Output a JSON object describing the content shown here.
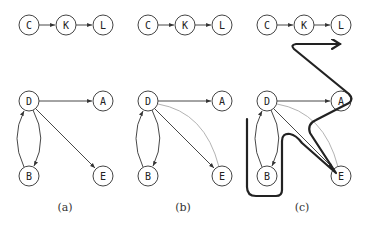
{
  "panels": [
    {
      "caption": "(a)",
      "nodes": {
        "C": "C",
        "K": "K",
        "L": "L",
        "D": "D",
        "A": "A",
        "B": "B",
        "E": "E"
      }
    },
    {
      "caption": "(b)",
      "nodes": {
        "C": "C",
        "K": "K",
        "L": "L",
        "D": "D",
        "A": "A",
        "B": "B",
        "E": "E"
      }
    },
    {
      "caption": "(c)",
      "nodes": {
        "C": "C",
        "K": "K",
        "L": "L",
        "D": "D",
        "A": "A",
        "B": "B",
        "E": "E"
      }
    }
  ],
  "edges": {
    "a": [
      "C->K",
      "K->L",
      "D->A",
      "D->E",
      "D->B",
      "B->D"
    ],
    "b": [
      "C->K",
      "K->L",
      "D->A",
      "D->E",
      "D->B",
      "B->D",
      "E->D (light)"
    ],
    "c": [
      "C->K",
      "K->L",
      "D->A",
      "D->E",
      "D->B",
      "B->D",
      "E->D (light)",
      "bold path"
    ]
  },
  "colors": {
    "edge": "#333333",
    "light_edge": "#aaaaaa",
    "bold_path": "#222222"
  }
}
